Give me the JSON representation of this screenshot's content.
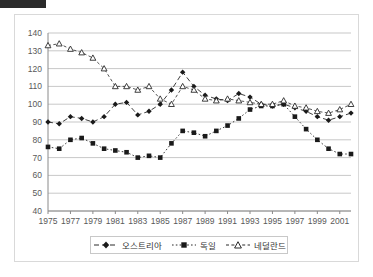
{
  "window": {
    "titlebar_name": "title-bar"
  },
  "chart_data": {
    "type": "line",
    "title": "",
    "xlabel": "",
    "ylabel": "",
    "ylim": [
      40,
      140
    ],
    "yticks": [
      40,
      50,
      60,
      70,
      80,
      90,
      100,
      110,
      120,
      130,
      140
    ],
    "xlim": [
      1975,
      2002
    ],
    "xticks": [
      1975,
      1977,
      1979,
      1981,
      1983,
      1985,
      1987,
      1989,
      1991,
      1993,
      1995,
      1997,
      1999,
      2001
    ],
    "grid": true,
    "legend_position": "bottom",
    "x": [
      1975,
      1976,
      1977,
      1978,
      1979,
      1980,
      1981,
      1982,
      1983,
      1984,
      1985,
      1986,
      1987,
      1988,
      1989,
      1990,
      1991,
      1992,
      1993,
      1994,
      1995,
      1996,
      1997,
      1998,
      1999,
      2000,
      2001,
      2002
    ],
    "series": [
      {
        "name": "오스트리아",
        "marker": "filled-diamond",
        "color": "#1a1a1a",
        "values": [
          90,
          89,
          93,
          92,
          90,
          93,
          100,
          101,
          94,
          96,
          100,
          108,
          118,
          110,
          105,
          103,
          102,
          106,
          104,
          100,
          99,
          100,
          98,
          96,
          93,
          91,
          93,
          95
        ]
      },
      {
        "name": "독일",
        "marker": "filled-square",
        "color": "#1a1a1a",
        "values": [
          76,
          75,
          80,
          81,
          78,
          75,
          74,
          73,
          70,
          71,
          70,
          78,
          85,
          84,
          82,
          85,
          88,
          92,
          97,
          99,
          99,
          100,
          93,
          86,
          80,
          75,
          72,
          72
        ]
      },
      {
        "name": "네덜란드",
        "marker": "open-triangle",
        "color": "#2a2a2a",
        "values": [
          133,
          134,
          131,
          129,
          126,
          120,
          110,
          110,
          108,
          110,
          103,
          100,
          110,
          108,
          103,
          102,
          103,
          102,
          101,
          100,
          100,
          102,
          99,
          98,
          96,
          95,
          97,
          100
        ]
      }
    ]
  },
  "legend": {
    "items": [
      {
        "label": "오스트리아",
        "marker": "filled-diamond"
      },
      {
        "label": "독일",
        "marker": "filled-square"
      },
      {
        "label": "네덜란드",
        "marker": "open-triangle"
      }
    ]
  }
}
